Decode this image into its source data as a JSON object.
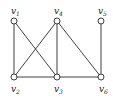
{
  "graph": {
    "nodes": [
      {
        "id": "v1",
        "base": "v",
        "sub": "1",
        "x": 14,
        "y": 21,
        "lx": 14,
        "ly": 14
      },
      {
        "id": "v4",
        "base": "v",
        "sub": "4",
        "x": 57,
        "y": 21,
        "lx": 57,
        "ly": 14
      },
      {
        "id": "v5",
        "base": "v",
        "sub": "5",
        "x": 101,
        "y": 21,
        "lx": 101,
        "ly": 14
      },
      {
        "id": "v2",
        "base": "v",
        "sub": "2",
        "x": 14,
        "y": 77,
        "lx": 14,
        "ly": 92
      },
      {
        "id": "v3",
        "base": "v",
        "sub": "3",
        "x": 57,
        "y": 77,
        "lx": 57,
        "ly": 92
      },
      {
        "id": "v6",
        "base": "v",
        "sub": "6",
        "x": 101,
        "y": 77,
        "lx": 102,
        "ly": 92
      }
    ],
    "edges": [
      [
        "v1",
        "v2"
      ],
      [
        "v1",
        "v3"
      ],
      [
        "v4",
        "v2"
      ],
      [
        "v4",
        "v3"
      ],
      [
        "v4",
        "v6"
      ],
      [
        "v5",
        "v6"
      ],
      [
        "v2",
        "v3"
      ],
      [
        "v3",
        "v6"
      ]
    ],
    "colors": {
      "stroke": "#2a2a2a",
      "fill": "#ffffff",
      "label": "#222222"
    }
  }
}
